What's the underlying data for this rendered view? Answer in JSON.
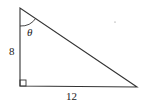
{
  "diagram": {
    "type": "right-triangle",
    "vertices": {
      "top": [
        20,
        8
      ],
      "right_angle": [
        20,
        86
      ],
      "right": [
        137,
        87
      ]
    },
    "labels": {
      "vertical_leg": "8",
      "horizontal_leg": "12",
      "angle": "θ"
    },
    "colors": {
      "stroke": "#333333",
      "background": "#ffffff"
    }
  }
}
